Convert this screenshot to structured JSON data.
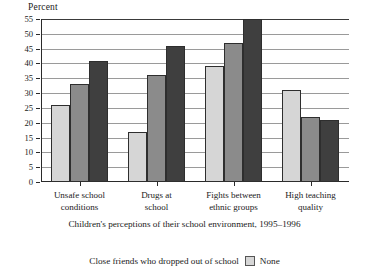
{
  "chart_data": {
    "type": "bar",
    "title": "",
    "ylabel": "Percent",
    "xlabel": "",
    "ylim": [
      0,
      55
    ],
    "ytick_step": 5,
    "yticks": [
      0,
      5,
      10,
      15,
      20,
      25,
      30,
      35,
      40,
      45,
      50,
      55
    ],
    "grid": true,
    "legend_position": "bottom",
    "categories": [
      "Unsafe school conditions",
      "Drugs at school",
      "Fights between ethnic groups",
      "High teaching quality"
    ],
    "category_lines": [
      [
        "Unsafe school",
        "conditions"
      ],
      [
        "Drugs at",
        "school"
      ],
      [
        "Fights between",
        "ethnic groups"
      ],
      [
        "High teaching",
        "quality"
      ]
    ],
    "series": [
      {
        "name": "None",
        "color": "#d6d6d6",
        "values": [
          26,
          17,
          39,
          31
        ]
      },
      {
        "name": "Some",
        "color": "#8b8b8b",
        "values": [
          33,
          36,
          47,
          22
        ]
      },
      {
        "name": "Many",
        "color": "#3f3f3f",
        "values": [
          41,
          46,
          55,
          21
        ]
      }
    ],
    "caption": "Children's perceptions of their school environment, 1995–1996",
    "legend": {
      "title": "Close friends who dropped out of school",
      "visible_items": [
        {
          "label": "None",
          "color": "#d6d6d6"
        }
      ]
    }
  }
}
